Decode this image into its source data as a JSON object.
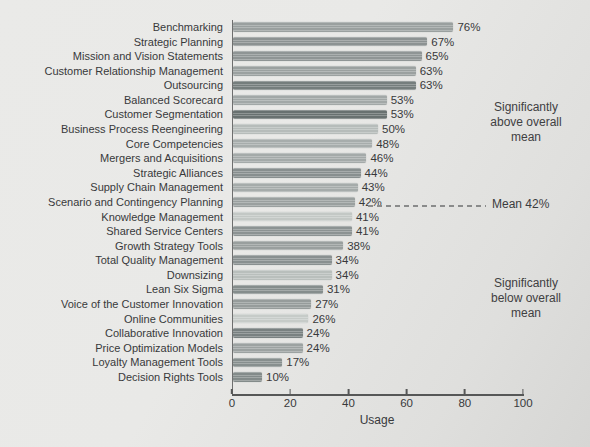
{
  "chart_data": {
    "type": "bar",
    "orientation": "horizontal",
    "title": "",
    "xlabel": "Usage",
    "xlim": [
      0,
      100
    ],
    "x_ticks": [
      "0",
      "20",
      "40",
      "60",
      "80",
      "100"
    ],
    "grid": false,
    "legend": "none",
    "categories": [
      "Benchmarking",
      "Strategic Planning",
      "Mission and Vision Statements",
      "Customer Relationship Management",
      "Outsourcing",
      "Balanced Scorecard",
      "Customer Segmentation",
      "Business Process Reengineering",
      "Core Competencies",
      "Mergers and Acquisitions",
      "Strategic Alliances",
      "Supply Chain Management",
      "Scenario and Contingency Planning",
      "Knowledge Management",
      "Shared Service Centers",
      "Growth Strategy Tools",
      "Total Quality Management",
      "Downsizing",
      "Lean Six Sigma",
      "Voice of the Customer Innovation",
      "Online Communities",
      "Collaborative Innovation",
      "Price Optimization Models",
      "Loyalty Management Tools",
      "Decision Rights Tools"
    ],
    "values": [
      76,
      67,
      65,
      63,
      63,
      53,
      53,
      50,
      48,
      46,
      44,
      43,
      42,
      41,
      41,
      38,
      34,
      34,
      31,
      27,
      26,
      24,
      24,
      17,
      10
    ],
    "value_labels": [
      "76%",
      "67%",
      "65%",
      "63%",
      "63%",
      "53%",
      "53%",
      "50%",
      "48%",
      "46%",
      "44%",
      "43%",
      "42%",
      "41%",
      "41%",
      "38%",
      "34%",
      "34%",
      "31%",
      "27%",
      "26%",
      "24%",
      "24%",
      "17%",
      "10%"
    ],
    "bar_colors": [
      "#9aa09f",
      "#8c9292",
      "#8f9595",
      "#9ba1a0",
      "#757e7d",
      "#a2a8a7",
      "#687170",
      "#b6bcba",
      "#a7adac",
      "#a4aaa9",
      "#888f8f",
      "#a5abaa",
      "#9aa09f",
      "#c3c8c5",
      "#8c9393",
      "#999f9e",
      "#899090",
      "#b9bfbc",
      "#858d8c",
      "#969c9b",
      "#c6cbc8",
      "#798181",
      "#9ca2a1",
      "#878f8e",
      "#838b8a"
    ],
    "mean_value": 42
  },
  "axis": {
    "xlabel": "Usage"
  },
  "annotations": {
    "above": "Significantly\nabove overall\nmean",
    "mean_label": "Mean 42%",
    "below": "Significantly\nbelow overall\nmean"
  },
  "layout": {
    "axis_color": "#565757",
    "text_color": "#38393b",
    "background_top": "#eaeae8",
    "background_bottom": "#d6d6d4"
  }
}
